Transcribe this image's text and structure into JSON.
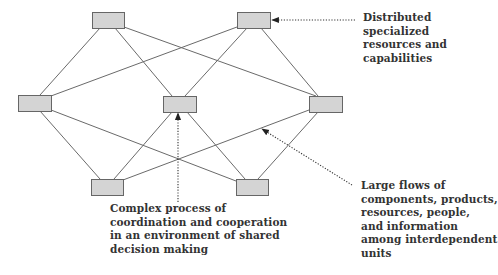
{
  "colors": {
    "node_fill": "#d4d4d4",
    "node_stroke": "#666666",
    "edge": "#6a6a6a",
    "annotation": "#333333",
    "text": "#333333"
  },
  "nodes": [
    {
      "id": "top-left",
      "x": 92,
      "y": 12,
      "w": 32,
      "h": 16
    },
    {
      "id": "top-right",
      "x": 237,
      "y": 12,
      "w": 33,
      "h": 16
    },
    {
      "id": "mid-left",
      "x": 18,
      "y": 95,
      "w": 33,
      "h": 16
    },
    {
      "id": "mid-center",
      "x": 163,
      "y": 96,
      "w": 33,
      "h": 16
    },
    {
      "id": "mid-right",
      "x": 309,
      "y": 96,
      "w": 33,
      "h": 16
    },
    {
      "id": "bottom-left",
      "x": 91,
      "y": 179,
      "w": 32,
      "h": 16
    },
    {
      "id": "bottom-right",
      "x": 236,
      "y": 179,
      "w": 32,
      "h": 16
    }
  ],
  "edges": [
    {
      "from": "top-left",
      "to": "mid-left",
      "x1": 100,
      "y1": 28,
      "x2": 40,
      "y2": 95
    },
    {
      "from": "top-left",
      "to": "mid-center",
      "x1": 115,
      "y1": 28,
      "x2": 172,
      "y2": 96
    },
    {
      "from": "top-left",
      "to": "mid-right",
      "x1": 124,
      "y1": 27,
      "x2": 316,
      "y2": 96
    },
    {
      "from": "top-right",
      "to": "mid-left",
      "x1": 237,
      "y1": 27,
      "x2": 51,
      "y2": 96
    },
    {
      "from": "top-right",
      "to": "mid-center",
      "x1": 247,
      "y1": 28,
      "x2": 185,
      "y2": 96
    },
    {
      "from": "top-right",
      "to": "mid-right",
      "x1": 261,
      "y1": 28,
      "x2": 318,
      "y2": 96
    },
    {
      "from": "mid-left",
      "to": "bottom-left",
      "x1": 40,
      "y1": 111,
      "x2": 100,
      "y2": 179
    },
    {
      "from": "mid-left",
      "to": "bottom-right",
      "x1": 51,
      "y1": 110,
      "x2": 236,
      "y2": 181
    },
    {
      "from": "mid-center",
      "to": "bottom-left",
      "x1": 172,
      "y1": 112,
      "x2": 114,
      "y2": 179
    },
    {
      "from": "mid-center",
      "to": "bottom-right",
      "x1": 187,
      "y1": 112,
      "x2": 245,
      "y2": 179
    },
    {
      "from": "mid-right",
      "to": "bottom-left",
      "x1": 309,
      "y1": 110,
      "x2": 123,
      "y2": 180
    },
    {
      "from": "mid-right",
      "to": "bottom-right",
      "x1": 318,
      "y1": 112,
      "x2": 258,
      "y2": 179
    }
  ],
  "annotations": [
    {
      "id": "distributed",
      "lines": [
        "Distributed",
        "specialized",
        "resources and",
        "capabilities"
      ],
      "text_x": 363,
      "text_y": 11,
      "arrow": {
        "x1": 355,
        "y1": 20,
        "x2": 272,
        "y2": 20
      }
    },
    {
      "id": "complex-process",
      "lines": [
        "Complex process of",
        "coordination and cooperation",
        "in an environment of shared",
        "decision making"
      ],
      "text_x": 110,
      "text_y": 202,
      "arrow": {
        "x1": 178,
        "y1": 202,
        "x2": 178,
        "y2": 113
      }
    },
    {
      "id": "large-flows",
      "lines": [
        "Large flows of",
        "components, products,",
        "resources, people,",
        "and information",
        "among interdependent",
        "units"
      ],
      "text_x": 361,
      "text_y": 179,
      "arrow": {
        "x1": 352,
        "y1": 185,
        "x2": 262,
        "y2": 129
      }
    }
  ]
}
